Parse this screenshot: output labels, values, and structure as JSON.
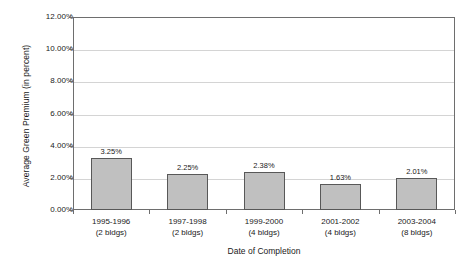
{
  "chart_data": {
    "type": "bar",
    "title": "",
    "subtitle": "",
    "xlabel": "Date of Completion",
    "ylabel": "Average Green Premium (in percent)",
    "categories": [
      "1995-1996",
      "1997-1998",
      "1999-2000",
      "2001-2002",
      "2003-2004"
    ],
    "category_sublabels": [
      "(2 bldgs)",
      "(2 bldgs)",
      "(4 bldgs)",
      "(4 bldgs)",
      "(8 bldgs)"
    ],
    "values": [
      3.25,
      2.25,
      2.38,
      1.63,
      2.01
    ],
    "data_labels": [
      "3.25%",
      "2.25%",
      "2.38%",
      "1.63%",
      "2.01%"
    ],
    "ylim": [
      0,
      12
    ],
    "ytick_values": [
      0,
      2,
      4,
      6,
      8,
      10,
      12
    ],
    "ytick_labels": [
      "0.00%",
      "2.00%",
      "4.00%",
      "6.00%",
      "8.00%",
      "10.00%",
      "12.00%"
    ],
    "grid": true,
    "legend": false,
    "legend_position": "none",
    "bar_color": "#c0c0c0",
    "bar_border_color": "#585858",
    "gridline_color": "#d4d4d4",
    "axis_color": "#6e6e6e",
    "background_color": "#ffffff"
  }
}
